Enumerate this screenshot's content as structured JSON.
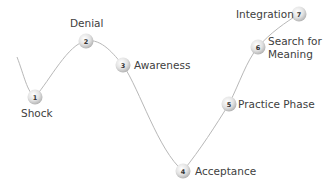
{
  "diagram": {
    "type": "change-curve",
    "line_color": "#b8b8b8",
    "node_fill_light": "#ffffff",
    "node_fill_dark": "#bdbdbd",
    "text_color": "#404040",
    "stages": [
      {
        "number": "1",
        "label": "Shock"
      },
      {
        "number": "2",
        "label": "Denial"
      },
      {
        "number": "3",
        "label": "Awareness"
      },
      {
        "number": "4",
        "label": "Acceptance"
      },
      {
        "number": "5",
        "label": "Practice Phase"
      },
      {
        "number": "6",
        "label_line1": "Search for",
        "label_line2": "Meaning"
      },
      {
        "number": "7",
        "label": "Integration"
      }
    ]
  }
}
